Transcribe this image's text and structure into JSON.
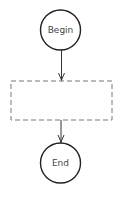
{
  "diagram": {
    "type": "flowchart",
    "nodes": [
      {
        "id": "begin",
        "shape": "circle",
        "label": "Begin"
      },
      {
        "id": "process",
        "shape": "dashed-rectangle",
        "label": ""
      },
      {
        "id": "end",
        "shape": "circle",
        "label": "End"
      }
    ],
    "edges": [
      {
        "from": "begin",
        "to": "process"
      },
      {
        "from": "process",
        "to": "end"
      }
    ],
    "colors": {
      "stroke": "#222222",
      "dashed_stroke": "#777777",
      "text": "#444444",
      "background": "#ffffff"
    }
  }
}
